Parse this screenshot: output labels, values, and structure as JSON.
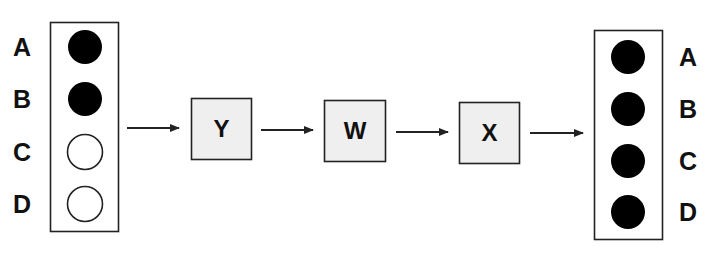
{
  "diagram": {
    "colors": {
      "stroke": "#222222",
      "filled": "#000000",
      "empty": "#ffffff",
      "node_fill": "#efefef",
      "text": "#111111"
    },
    "input_panel": {
      "rows": [
        {
          "label": "A",
          "state": "filled"
        },
        {
          "label": "B",
          "state": "filled"
        },
        {
          "label": "C",
          "state": "empty"
        },
        {
          "label": "D",
          "state": "empty"
        }
      ]
    },
    "nodes": [
      {
        "label": "Y"
      },
      {
        "label": "W"
      },
      {
        "label": "X"
      }
    ],
    "output_panel": {
      "rows": [
        {
          "label": "A",
          "state": "filled"
        },
        {
          "label": "B",
          "state": "filled"
        },
        {
          "label": "C",
          "state": "filled"
        },
        {
          "label": "D",
          "state": "filled"
        }
      ]
    },
    "flow": [
      "input_panel",
      "Y",
      "W",
      "X",
      "output_panel"
    ]
  }
}
